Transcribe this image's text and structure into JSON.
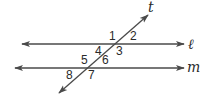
{
  "diagram": {
    "colors": {
      "stroke": "#4a4a4a",
      "text": "#2a2a2a",
      "background": "#ffffff"
    },
    "lines": {
      "l": {
        "label": "ℓ",
        "x1": 22,
        "y1": 44,
        "x2": 184,
        "y2": 44
      },
      "m": {
        "label": "m",
        "x1": 15,
        "y1": 68,
        "x2": 184,
        "y2": 68
      },
      "t": {
        "label": "t",
        "x1": 59,
        "y1": 93,
        "x2": 148,
        "y2": 15
      }
    },
    "angles": [
      {
        "id": "1",
        "label": "1"
      },
      {
        "id": "2",
        "label": "2"
      },
      {
        "id": "3",
        "label": "3"
      },
      {
        "id": "4",
        "label": "4"
      },
      {
        "id": "5",
        "label": "5"
      },
      {
        "id": "6",
        "label": "6"
      },
      {
        "id": "7",
        "label": "7"
      },
      {
        "id": "8",
        "label": "8"
      }
    ]
  }
}
